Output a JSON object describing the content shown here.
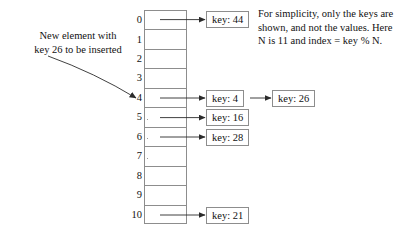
{
  "figure": {
    "title_annotation": "New element with\nkey 26 to be inserted",
    "caption": "For simplicity, only the keys are\nshown, and not the values. Here\nN is 11 and index = key % N.",
    "table_size_n": 11,
    "hash_function": "index = key % N",
    "colors": {
      "stroke": "#8d8d8d",
      "text": "#111111",
      "arrow": "#333333",
      "background": "#ffffff"
    }
  },
  "table": {
    "indices": [
      "0",
      "1",
      "2",
      "3",
      "4",
      "5",
      "6",
      "7",
      "8",
      "9",
      "10"
    ],
    "slots": [
      {
        "index": "0",
        "key_label": "key: 44",
        "key": 44,
        "occupied": true
      },
      {
        "index": "1",
        "key_label": "",
        "key": null,
        "occupied": false
      },
      {
        "index": "2",
        "key_label": "",
        "key": null,
        "occupied": false
      },
      {
        "index": "3",
        "key_label": "",
        "key": null,
        "occupied": false
      },
      {
        "index": "4",
        "key_label": "key: 4",
        "key": 4,
        "occupied": true
      },
      {
        "index": "5",
        "key_label": "key: 16",
        "key": 16,
        "occupied": true
      },
      {
        "index": "6",
        "key_label": "key: 28",
        "key": 28,
        "occupied": true
      },
      {
        "index": "7",
        "key_label": "",
        "key": null,
        "occupied": false
      },
      {
        "index": "8",
        "key_label": "",
        "key": null,
        "occupied": false
      },
      {
        "index": "9",
        "key_label": "",
        "key": null,
        "occupied": false
      },
      {
        "index": "10",
        "key_label": "key: 21",
        "key": 21,
        "occupied": true
      }
    ]
  },
  "new_element": {
    "key_label": "key: 26",
    "key": 26,
    "target_index": "4"
  }
}
